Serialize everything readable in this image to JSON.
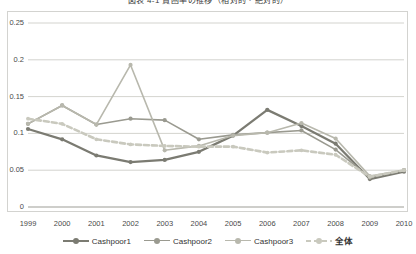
{
  "chart_data": {
    "type": "line",
    "title": "図表 4-1 貧困率の推移（相対的・絶対的）",
    "xlabel": "",
    "ylabel": "",
    "x": [
      1999,
      2000,
      2001,
      2002,
      2003,
      2004,
      2005,
      2006,
      2007,
      2008,
      2009,
      2010
    ],
    "categories": [
      "1999",
      "2000",
      "2001",
      "2002",
      "2003",
      "2004",
      "2005",
      "2006",
      "2007",
      "2008",
      "2009",
      "2010"
    ],
    "ylim": [
      0,
      0.25
    ],
    "yticks": [
      0,
      0.05,
      0.1,
      0.15,
      0.2,
      0.25
    ],
    "ytick_labels": [
      "0",
      "0.05",
      "0.1",
      "0.15",
      "0.2",
      "0.25"
    ],
    "grid": "horizontal",
    "legend_position": "bottom",
    "series": [
      {
        "name": "Cashpoor1",
        "color": "#7b7b72",
        "style": "solid",
        "width": 2.3,
        "marker": "circle",
        "values": [
          0.106,
          0.092,
          0.07,
          0.061,
          0.064,
          0.075,
          0.097,
          0.132,
          0.11,
          0.086,
          0.038,
          0.048
        ]
      },
      {
        "name": "Cashpoor2",
        "color": "#9a9a90",
        "style": "solid",
        "width": 1.6,
        "marker": "circle",
        "values": [
          0.113,
          0.138,
          0.112,
          0.12,
          0.118,
          0.092,
          0.098,
          0.101,
          0.104,
          0.078,
          0.04,
          0.05
        ]
      },
      {
        "name": "Cashpoor3",
        "color": "#b8b8ad",
        "style": "solid",
        "width": 1.6,
        "marker": "circle",
        "values": [
          0.113,
          0.138,
          0.112,
          0.193,
          0.077,
          0.083,
          0.097,
          0.101,
          0.114,
          0.093,
          0.042,
          0.05
        ]
      },
      {
        "name": "全体",
        "color": "#c9c9be",
        "style": "dashed",
        "width": 2.6,
        "marker": "circle",
        "values": [
          0.12,
          0.113,
          0.092,
          0.085,
          0.083,
          0.082,
          0.082,
          0.074,
          0.077,
          0.071,
          0.041,
          0.05
        ]
      }
    ]
  }
}
